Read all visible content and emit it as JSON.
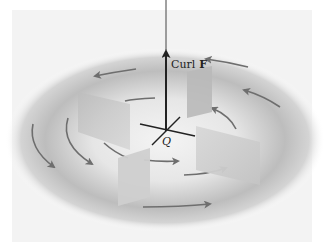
{
  "figure": {
    "vector_label": "Curl",
    "vector_symbol": "F",
    "point_label": "Q"
  },
  "colors": {
    "background": "#ffffff",
    "field_shadow": "#9a9a9a",
    "arrow": "#6e6e6e",
    "axis": "#222222",
    "paddle": "#c8c8c8"
  }
}
